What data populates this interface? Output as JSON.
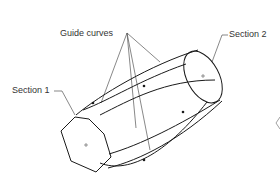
{
  "diagram": {
    "type": "loft-with-guide-curves",
    "labels": {
      "guide_curves": "Guide curves",
      "section_1": "Section 1",
      "section_2": "Section 2"
    },
    "colors": {
      "background": "#ffffff",
      "geometry": "#1a1a1a",
      "leader": "#555555",
      "text": "#333333"
    },
    "sections": [
      {
        "id": "section_1",
        "shape": "hexagon"
      },
      {
        "id": "section_2",
        "shape": "ellipse"
      }
    ],
    "guide_curve_count": 4
  }
}
